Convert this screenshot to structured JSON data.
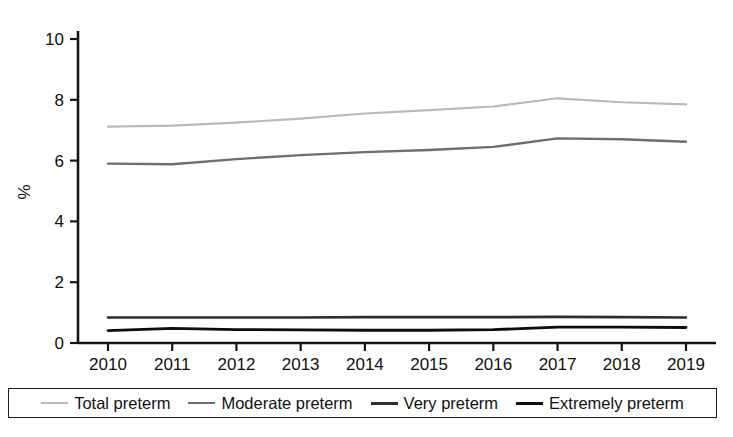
{
  "chart_data": {
    "type": "line",
    "title": "",
    "xlabel": "",
    "ylabel": "%",
    "x": [
      2010,
      2011,
      2012,
      2013,
      2014,
      2015,
      2016,
      2017,
      2018,
      2019
    ],
    "categories": [
      "2010",
      "2011",
      "2012",
      "2013",
      "2014",
      "2015",
      "2016",
      "2017",
      "2018",
      "2019"
    ],
    "xlim": [
      2010,
      2019
    ],
    "ylim": [
      0,
      10
    ],
    "yticks": [
      0,
      2,
      4,
      6,
      8,
      10
    ],
    "ytick_labels": [
      "0",
      "2",
      "4",
      "6",
      "8",
      "10"
    ],
    "grid": false,
    "legend_position": "bottom",
    "series": [
      {
        "name": "Total preterm",
        "color": "#b9b9b9",
        "width": 2.2,
        "values": [
          7.12,
          7.15,
          7.25,
          7.38,
          7.55,
          7.66,
          7.78,
          8.05,
          7.92,
          7.85
        ]
      },
      {
        "name": "Moderate preterm",
        "color": "#6e6e6e",
        "width": 2.4,
        "values": [
          5.9,
          5.88,
          6.05,
          6.18,
          6.28,
          6.35,
          6.45,
          6.73,
          6.7,
          6.62
        ]
      },
      {
        "name": "Very preterm",
        "color": "#2e2e2e",
        "width": 2.6,
        "values": [
          0.84,
          0.84,
          0.84,
          0.84,
          0.85,
          0.85,
          0.85,
          0.86,
          0.85,
          0.84
        ]
      },
      {
        "name": "Extremely preterm",
        "color": "#0d0d0d",
        "width": 2.8,
        "values": [
          0.41,
          0.48,
          0.44,
          0.43,
          0.42,
          0.42,
          0.44,
          0.52,
          0.52,
          0.51
        ]
      }
    ]
  },
  "legend": {
    "entries": [
      {
        "label": "Total preterm",
        "color": "#b9b9b9",
        "width": 2.2
      },
      {
        "label": "Moderate preterm",
        "color": "#6e6e6e",
        "width": 2.6
      },
      {
        "label": "Very preterm",
        "color": "#2e2e2e",
        "width": 3.0
      },
      {
        "label": "Extremely preterm",
        "color": "#0d0d0d",
        "width": 3.4
      }
    ]
  },
  "axes": {
    "y_title": "%",
    "axis_color": "#151515"
  }
}
